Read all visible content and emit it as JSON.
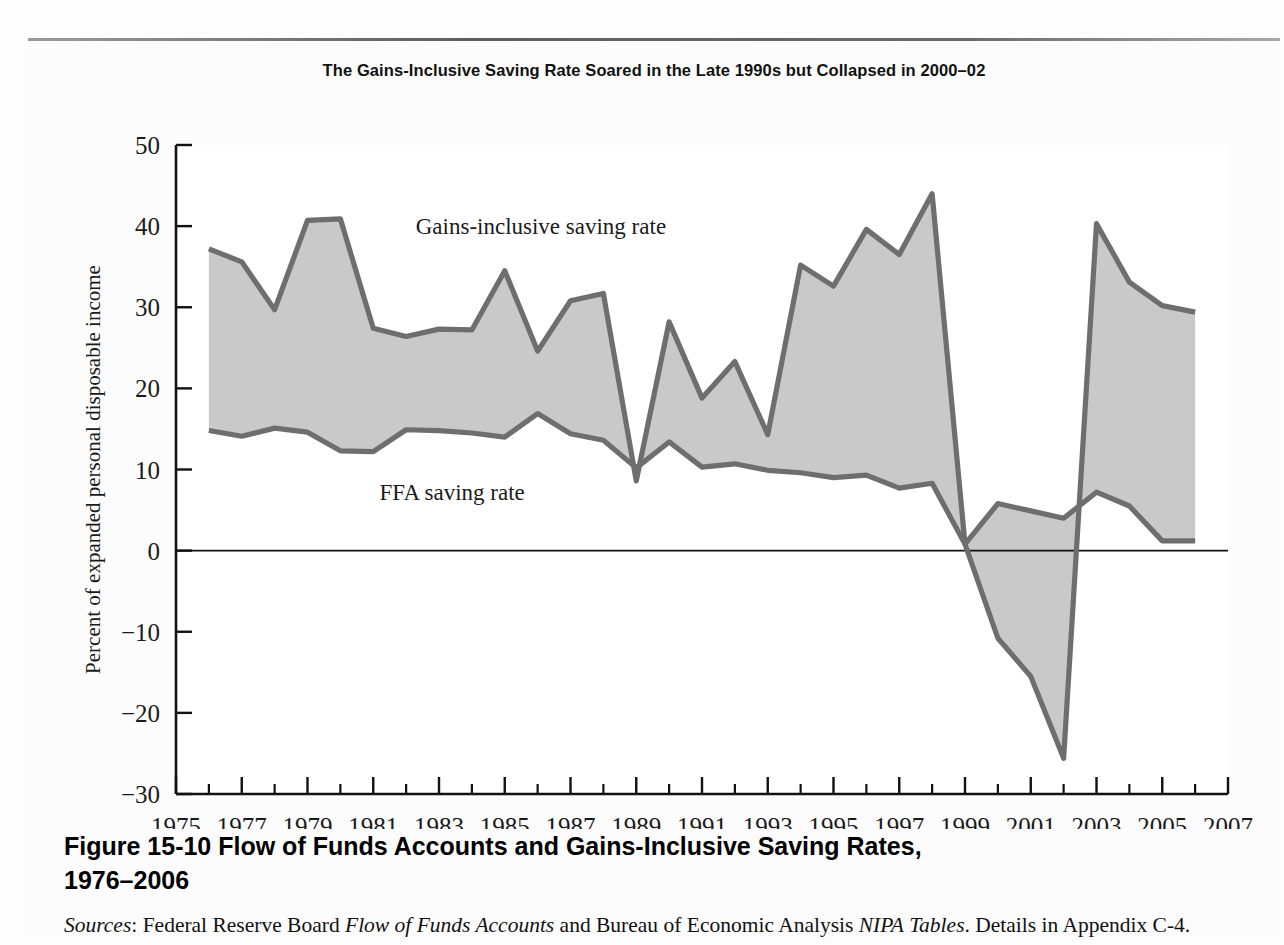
{
  "figure": {
    "chart_title": "The Gains-Inclusive Saving Rate Soared in the Late 1990s but Collapsed in 2000–02",
    "figure_number": "Figure 15-10",
    "caption_line1": "Flow of Funds Accounts and Gains-Inclusive Saving Rates,",
    "caption_line2": "1976–2006",
    "sources_label": "Sources",
    "sources_text_a": ": Federal Reserve Board ",
    "sources_italic_a": "Flow of Funds Accounts",
    "sources_text_b": " and Bureau of Economic Analysis ",
    "sources_italic_b": "NIPA",
    "sources_italic_c": "Tables",
    "sources_text_c": ". Details in Appendix C-4."
  },
  "colors": {
    "line": "#6e6e6e",
    "fill": "#c9c9c9",
    "axis": "#111111",
    "plot_background": "#ffffff",
    "page_background": "#fcfcfc"
  },
  "chart_data": {
    "type": "area",
    "title": "The Gains-Inclusive Saving Rate Soared in the Late 1990s but Collapsed in 2000–02",
    "xlabel": "",
    "ylabel": "Percent of expanded personal disposable income",
    "xlim": [
      1975,
      2007
    ],
    "ylim": [
      -30,
      50
    ],
    "yticks": [
      50,
      40,
      30,
      20,
      10,
      0,
      -10,
      -20,
      -30
    ],
    "ytick_labels": [
      "50",
      "40",
      "30",
      "20",
      "10",
      "0",
      "−10",
      "−20",
      "−30"
    ],
    "xticks": [
      1975,
      1977,
      1979,
      1981,
      1983,
      1985,
      1987,
      1989,
      1991,
      1993,
      1995,
      1997,
      1999,
      2001,
      2003,
      2005,
      2007
    ],
    "xtick_labels": [
      "1975",
      "1977",
      "1979",
      "1981",
      "1983",
      "1985",
      "1987",
      "1989",
      "1991",
      "1993",
      "1995",
      "1997",
      "1999",
      "2001",
      "2003",
      "2005",
      "2007"
    ],
    "minor_xticks": [
      1976,
      1978,
      1980,
      1982,
      1984,
      1986,
      1988,
      1990,
      1992,
      1994,
      1996,
      1998,
      2000,
      2002,
      2004,
      2006
    ],
    "grid": false,
    "legend": "inline-annotations",
    "zero_line": 0,
    "x": [
      1976,
      1977,
      1978,
      1979,
      1980,
      1981,
      1982,
      1983,
      1984,
      1985,
      1986,
      1987,
      1988,
      1989,
      1990,
      1991,
      1992,
      1993,
      1994,
      1995,
      1996,
      1997,
      1998,
      1999,
      2000,
      2001,
      2002,
      2003,
      2004,
      2005,
      2006
    ],
    "series": [
      {
        "name": "Gains-inclusive saving rate",
        "label": "Gains-inclusive saving rate",
        "values": [
          37.2,
          35.6,
          29.7,
          40.7,
          40.9,
          27.4,
          26.4,
          27.3,
          27.2,
          34.5,
          24.6,
          30.8,
          31.7,
          8.6,
          28.2,
          18.8,
          23.3,
          14.3,
          35.2,
          32.6,
          39.6,
          36.5,
          44.0,
          0.8,
          -10.8,
          -15.5,
          -25.6,
          40.3,
          33.1,
          30.2,
          29.4
        ]
      },
      {
        "name": "FFA saving rate",
        "label": "FFA saving rate",
        "values": [
          14.8,
          14.1,
          15.1,
          14.6,
          12.3,
          12.2,
          14.9,
          14.8,
          14.5,
          14.0,
          16.9,
          14.4,
          13.6,
          10.2,
          13.4,
          10.3,
          10.7,
          9.9,
          9.6,
          9.0,
          9.3,
          7.7,
          8.3,
          0.8,
          5.8,
          4.9,
          4.0,
          7.2,
          5.5,
          1.2,
          1.2
        ]
      }
    ],
    "annotations": [
      {
        "text": "Gains-inclusive saving rate",
        "x": 1986.1,
        "y": 39.0
      },
      {
        "text": "FFA saving rate",
        "x": 1983.4,
        "y": 6.3
      }
    ]
  }
}
